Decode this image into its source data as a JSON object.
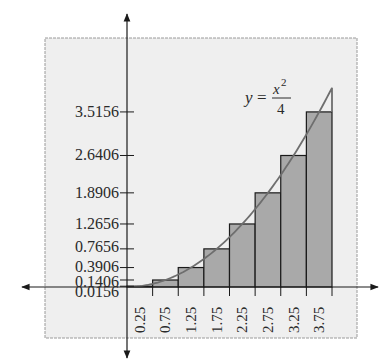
{
  "chart_data": {
    "type": "bar",
    "subtype": "riemann-sum-midpoint-with-curve",
    "title": "",
    "xlabel": "",
    "ylabel": "",
    "curve": {
      "label_lhs": "y",
      "label_eq": "=",
      "label_num_base": "x",
      "label_num_exp": "2",
      "label_den": "4",
      "expression": "y = x^2/4",
      "domain": [
        0,
        4
      ]
    },
    "categories": [
      "0.25",
      "0.75",
      "1.25",
      "1.75",
      "2.25",
      "2.75",
      "3.25",
      "3.75"
    ],
    "values": [
      0.0156,
      0.1406,
      0.3906,
      0.7656,
      1.2656,
      1.8906,
      2.6406,
      3.5156
    ],
    "bar_width": 0.5,
    "bar_left_edges": [
      0,
      0.5,
      1.0,
      1.5,
      2.0,
      2.5,
      3.0,
      3.5
    ],
    "y_tick_labels": [
      "0.0156",
      "0.1406",
      "0.3906",
      "0.7656",
      "1.2656",
      "1.8906",
      "2.6406",
      "3.5156"
    ],
    "x_tick_labels": [
      "0.25",
      "0.75",
      "1.25",
      "1.75",
      "2.25",
      "2.75",
      "3.25",
      "3.75"
    ],
    "xlim": [
      0,
      4
    ],
    "ylim": [
      0,
      4
    ],
    "grid": false,
    "legend": "none",
    "colors": {
      "panel": "#efefef",
      "panel_border": "#9a9a9a",
      "bar_fill": "#a9a9a9",
      "bar_stroke": "#1a1a1a",
      "curve": "#6e6e6e",
      "axis": "#1a1a1a"
    }
  }
}
